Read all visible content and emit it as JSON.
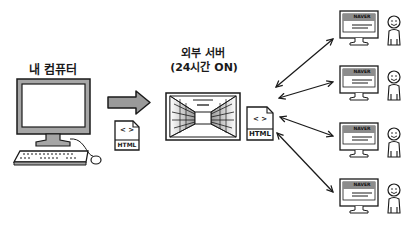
{
  "labels": {
    "my_computer": "내 컴퓨터",
    "external_server_line1": "외부 서버",
    "external_server_line2": "(24시간 ON)"
  },
  "files": {
    "left_file": {
      "symbol": "< >",
      "label": "HTML"
    },
    "right_file": {
      "symbol": "< >",
      "label": "HTML"
    }
  },
  "clients": [
    {
      "screen_brand": "NAVER"
    },
    {
      "screen_brand": "NAVER"
    },
    {
      "screen_brand": "NAVER"
    },
    {
      "screen_brand": "NAVER"
    }
  ],
  "colors": {
    "stroke": "#1a1a1a",
    "arrow_fill": "#9a9a9a",
    "monitor_frame": "#a6a6a6",
    "screen_header": "#8c8c8c",
    "background": "#ffffff"
  }
}
